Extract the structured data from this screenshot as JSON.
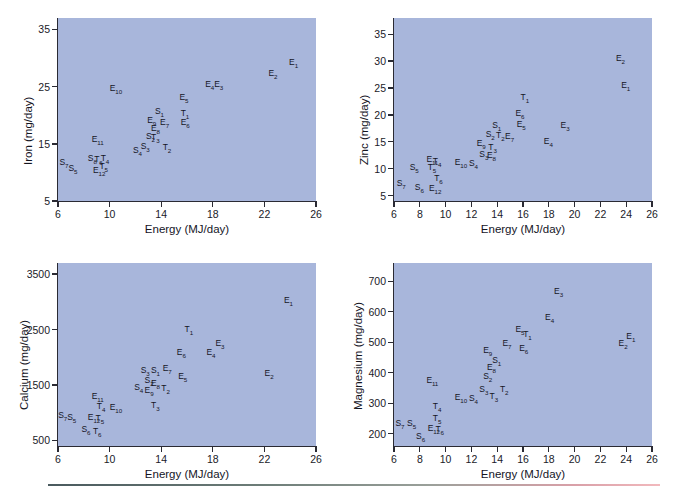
{
  "figure": {
    "background_color": "#ffffff",
    "plot_background_color": "#a8b6db",
    "axis_color": "#2a2a33",
    "label_color": "#15151f"
  },
  "chart_data": [
    {
      "type": "scatter",
      "title": "",
      "xlabel": "Energy (MJ/day)",
      "ylabel": "Iron (mg/day)",
      "xlim": [
        6,
        26
      ],
      "ylim": [
        5,
        37
      ],
      "xticks": [
        6,
        10,
        14,
        18,
        22,
        26
      ],
      "yticks": [
        5,
        15,
        25,
        35
      ],
      "grid": false,
      "legend": "none",
      "points": [
        {
          "label": "E",
          "sub": "1",
          "x": 24.3,
          "y": 29.2
        },
        {
          "label": "E",
          "sub": "2",
          "x": 22.7,
          "y": 27.2
        },
        {
          "label": "E",
          "sub": "3",
          "x": 18.5,
          "y": 25.3
        },
        {
          "label": "E",
          "sub": "4",
          "x": 17.8,
          "y": 25.3
        },
        {
          "label": "E",
          "sub": "5",
          "x": 15.8,
          "y": 23.0
        },
        {
          "label": "E",
          "sub": "10",
          "x": 10.4,
          "y": 24.5
        },
        {
          "label": "S",
          "sub": "1",
          "x": 13.9,
          "y": 20.6
        },
        {
          "label": "T",
          "sub": "1",
          "x": 15.9,
          "y": 20.3
        },
        {
          "label": "E",
          "sub": "9",
          "x": 13.3,
          "y": 19.0
        },
        {
          "label": "E",
          "sub": "7",
          "x": 14.3,
          "y": 18.6
        },
        {
          "label": "E",
          "sub": "6",
          "x": 15.9,
          "y": 18.6
        },
        {
          "label": "E",
          "sub": "8",
          "x": 13.6,
          "y": 17.6
        },
        {
          "label": "S",
          "sub": "2",
          "x": 13.2,
          "y": 16.2
        },
        {
          "label": "T",
          "sub": "3",
          "x": 13.6,
          "y": 16.0
        },
        {
          "label": "E",
          "sub": "11",
          "x": 9.0,
          "y": 15.6
        },
        {
          "label": "S",
          "sub": "3",
          "x": 12.8,
          "y": 14.4
        },
        {
          "label": "T",
          "sub": "2",
          "x": 14.5,
          "y": 14.2
        },
        {
          "label": "S",
          "sub": "4",
          "x": 12.2,
          "y": 13.8
        },
        {
          "label": "S",
          "sub": "8",
          "x": 8.7,
          "y": 12.4
        },
        {
          "label": "T",
          "sub": "6",
          "x": 9.2,
          "y": 12.1
        },
        {
          "label": "T",
          "sub": "4",
          "x": 9.7,
          "y": 12.3
        },
        {
          "label": "S",
          "sub": "7",
          "x": 6.5,
          "y": 11.6
        },
        {
          "label": "T",
          "sub": "5",
          "x": 9.6,
          "y": 10.9
        },
        {
          "label": "S",
          "sub": "5",
          "x": 7.2,
          "y": 10.6
        },
        {
          "label": "E",
          "sub": "12",
          "x": 9.1,
          "y": 10.3
        }
      ]
    },
    {
      "type": "scatter",
      "title": "",
      "xlabel": "Energy (MJ/day)",
      "ylabel": "Zinc (mg/day)",
      "xlim": [
        6,
        26
      ],
      "ylim": [
        4,
        38
      ],
      "xticks": [
        6,
        8,
        10,
        12,
        14,
        16,
        18,
        20,
        22,
        24,
        26
      ],
      "yticks": [
        5,
        10,
        15,
        20,
        25,
        30,
        35
      ],
      "grid": false,
      "legend": "none",
      "points": [
        {
          "label": "E",
          "sub": "2",
          "x": 23.6,
          "y": 30.4
        },
        {
          "label": "E",
          "sub": "1",
          "x": 24.0,
          "y": 25.3
        },
        {
          "label": "T",
          "sub": "1",
          "x": 16.2,
          "y": 23.2
        },
        {
          "label": "E",
          "sub": "6",
          "x": 15.8,
          "y": 20.2
        },
        {
          "label": "S",
          "sub": "1",
          "x": 14.0,
          "y": 17.9
        },
        {
          "label": "E",
          "sub": "5",
          "x": 15.9,
          "y": 18.1
        },
        {
          "label": "E",
          "sub": "3",
          "x": 19.3,
          "y": 17.9
        },
        {
          "label": "S",
          "sub": "2",
          "x": 13.5,
          "y": 16.2
        },
        {
          "label": "T",
          "sub": "2",
          "x": 14.3,
          "y": 16.0
        },
        {
          "label": "E",
          "sub": "7",
          "x": 15.0,
          "y": 15.8
        },
        {
          "label": "E",
          "sub": "4",
          "x": 18.0,
          "y": 14.9
        },
        {
          "label": "E",
          "sub": "9",
          "x": 12.8,
          "y": 14.6
        },
        {
          "label": "T",
          "sub": "3",
          "x": 13.7,
          "y": 13.8
        },
        {
          "label": "S",
          "sub": "3",
          "x": 13.0,
          "y": 12.6
        },
        {
          "label": "E",
          "sub": "8",
          "x": 13.6,
          "y": 12.4
        },
        {
          "label": "E",
          "sub": "11",
          "x": 8.9,
          "y": 11.6
        },
        {
          "label": "T",
          "sub": "4",
          "x": 9.4,
          "y": 11.2
        },
        {
          "label": "E",
          "sub": "10",
          "x": 11.1,
          "y": 11.0
        },
        {
          "label": "S",
          "sub": "4",
          "x": 12.2,
          "y": 10.9
        },
        {
          "label": "T",
          "sub": "5",
          "x": 9.0,
          "y": 10.1
        },
        {
          "label": "S",
          "sub": "5",
          "x": 7.6,
          "y": 10.1
        },
        {
          "label": "T",
          "sub": "6",
          "x": 9.5,
          "y": 8.0
        },
        {
          "label": "S",
          "sub": "7",
          "x": 6.6,
          "y": 7.2
        },
        {
          "label": "S",
          "sub": "6",
          "x": 8.0,
          "y": 6.4
        },
        {
          "label": "E",
          "sub": "12",
          "x": 9.1,
          "y": 6.3
        }
      ]
    },
    {
      "type": "scatter",
      "title": "",
      "xlabel": "Energy (MJ/day)",
      "ylabel": "Calcium (mg/day)",
      "xlim": [
        6,
        26
      ],
      "ylim": [
        400,
        3700
      ],
      "xticks": [
        6,
        10,
        14,
        18,
        22,
        26
      ],
      "yticks": [
        500,
        1500,
        2500,
        3500
      ],
      "grid": false,
      "legend": "none",
      "points": [
        {
          "label": "E",
          "sub": "1",
          "x": 23.9,
          "y": 3020
        },
        {
          "label": "T",
          "sub": "1",
          "x": 16.2,
          "y": 2500
        },
        {
          "label": "E",
          "sub": "3",
          "x": 18.6,
          "y": 2240
        },
        {
          "label": "E",
          "sub": "6",
          "x": 15.6,
          "y": 2080
        },
        {
          "label": "E",
          "sub": "4",
          "x": 17.9,
          "y": 2070
        },
        {
          "label": "E",
          "sub": "7",
          "x": 14.5,
          "y": 1790
        },
        {
          "label": "S",
          "sub": "3",
          "x": 12.8,
          "y": 1760
        },
        {
          "label": "S",
          "sub": "1",
          "x": 13.6,
          "y": 1750
        },
        {
          "label": "E",
          "sub": "2",
          "x": 22.4,
          "y": 1700
        },
        {
          "label": "E",
          "sub": "5",
          "x": 15.7,
          "y": 1650
        },
        {
          "label": "S",
          "sub": "2",
          "x": 13.1,
          "y": 1580
        },
        {
          "label": "E",
          "sub": "8",
          "x": 13.6,
          "y": 1520
        },
        {
          "label": "S",
          "sub": "4",
          "x": 12.3,
          "y": 1450
        },
        {
          "label": "E",
          "sub": "9",
          "x": 13.1,
          "y": 1400
        },
        {
          "label": "T",
          "sub": "2",
          "x": 14.4,
          "y": 1430
        },
        {
          "label": "E",
          "sub": "11",
          "x": 9.0,
          "y": 1280
        },
        {
          "label": "T",
          "sub": "3",
          "x": 13.6,
          "y": 1120
        },
        {
          "label": "T",
          "sub": "4",
          "x": 9.4,
          "y": 1100
        },
        {
          "label": "E",
          "sub": "10",
          "x": 10.4,
          "y": 1080
        },
        {
          "label": "S",
          "sub": "7",
          "x": 6.4,
          "y": 940
        },
        {
          "label": "S",
          "sub": "5",
          "x": 7.1,
          "y": 900
        },
        {
          "label": "E",
          "sub": "12",
          "x": 8.7,
          "y": 900
        },
        {
          "label": "T",
          "sub": "5",
          "x": 9.3,
          "y": 880
        },
        {
          "label": "S",
          "sub": "6",
          "x": 8.2,
          "y": 680
        },
        {
          "label": "T",
          "sub": "6",
          "x": 9.1,
          "y": 660
        }
      ]
    },
    {
      "type": "scatter",
      "title": "",
      "xlabel": "Energy (MJ/day)",
      "ylabel": "Magnesium (mg/day)",
      "xlim": [
        6,
        26
      ],
      "ylim": [
        160,
        760
      ],
      "xticks": [
        6,
        8,
        10,
        12,
        14,
        16,
        18,
        20,
        22,
        24,
        26
      ],
      "yticks": [
        200,
        300,
        400,
        500,
        600,
        700
      ],
      "grid": false,
      "legend": "none",
      "points": [
        {
          "label": "E",
          "sub": "3",
          "x": 18.8,
          "y": 665
        },
        {
          "label": "E",
          "sub": "4",
          "x": 18.1,
          "y": 580
        },
        {
          "label": "E",
          "sub": "5",
          "x": 15.8,
          "y": 540
        },
        {
          "label": "T",
          "sub": "1",
          "x": 16.4,
          "y": 525
        },
        {
          "label": "E",
          "sub": "1",
          "x": 24.4,
          "y": 518
        },
        {
          "label": "E",
          "sub": "2",
          "x": 23.8,
          "y": 495
        },
        {
          "label": "E",
          "sub": "7",
          "x": 14.8,
          "y": 495
        },
        {
          "label": "E",
          "sub": "6",
          "x": 16.1,
          "y": 478
        },
        {
          "label": "E",
          "sub": "9",
          "x": 13.3,
          "y": 472
        },
        {
          "label": "S",
          "sub": "1",
          "x": 14.0,
          "y": 440
        },
        {
          "label": "E",
          "sub": "8",
          "x": 13.6,
          "y": 415
        },
        {
          "label": "S",
          "sub": "2",
          "x": 13.3,
          "y": 385
        },
        {
          "label": "E",
          "sub": "11",
          "x": 8.9,
          "y": 372
        },
        {
          "label": "S",
          "sub": "3",
          "x": 13.0,
          "y": 345
        },
        {
          "label": "T",
          "sub": "2",
          "x": 14.6,
          "y": 345
        },
        {
          "label": "E",
          "sub": "10",
          "x": 11.1,
          "y": 318
        },
        {
          "label": "S",
          "sub": "4",
          "x": 12.2,
          "y": 315
        },
        {
          "label": "T",
          "sub": "3",
          "x": 13.8,
          "y": 322
        },
        {
          "label": "T",
          "sub": "4",
          "x": 9.4,
          "y": 287
        },
        {
          "label": "T",
          "sub": "5",
          "x": 9.4,
          "y": 248
        },
        {
          "label": "S",
          "sub": "7",
          "x": 6.5,
          "y": 232
        },
        {
          "label": "S",
          "sub": "5",
          "x": 7.4,
          "y": 232
        },
        {
          "label": "E",
          "sub": "12",
          "x": 9.0,
          "y": 215
        },
        {
          "label": "T",
          "sub": "6",
          "x": 9.6,
          "y": 213
        },
        {
          "label": "S",
          "sub": "6",
          "x": 8.1,
          "y": 188
        }
      ]
    }
  ]
}
